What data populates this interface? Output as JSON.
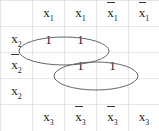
{
  "kmap": {
    "title": "",
    "col_headers_top": [
      {
        "var": "x",
        "sub": "1",
        "negated": false
      },
      {
        "var": "x",
        "sub": "1",
        "negated": false
      },
      {
        "var": "x",
        "sub": "1",
        "negated": true
      },
      {
        "var": "x",
        "sub": "1",
        "negated": true
      }
    ],
    "row_headers": [
      {
        "var": "x",
        "sub": "2",
        "negated": false
      },
      {
        "var": "x",
        "sub": "2",
        "negated": true
      },
      {
        "var": "x",
        "sub": "2",
        "negated": false
      }
    ],
    "col_headers_bottom": [
      {
        "var": "x",
        "sub": "3",
        "negated": false
      },
      {
        "var": "x",
        "sub": "3",
        "negated": true
      },
      {
        "var": "x",
        "sub": "3",
        "negated": true
      },
      {
        "var": "x",
        "sub": "3",
        "negated": false
      }
    ],
    "cells": [
      [
        "1",
        "1",
        "",
        ""
      ],
      [
        "",
        "1",
        "1",
        ""
      ],
      [
        "",
        "",
        "",
        ""
      ]
    ],
    "groups": [
      {
        "rows": [
          0
        ],
        "cols": [
          0,
          1
        ]
      },
      {
        "rows": [
          1
        ],
        "cols": [
          1,
          2
        ]
      }
    ]
  }
}
